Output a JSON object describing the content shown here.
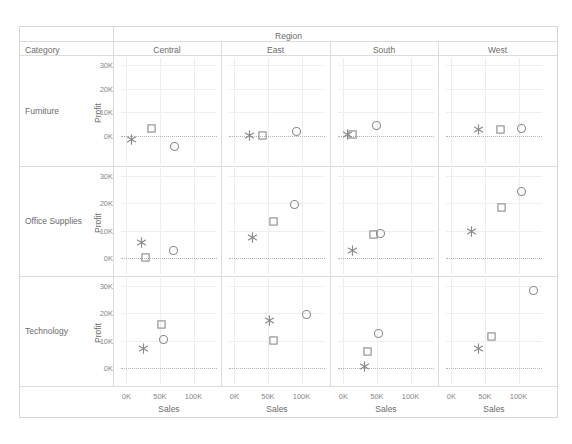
{
  "header": {
    "region_label": "Region",
    "category_label": "Category",
    "columns": [
      "Central",
      "East",
      "South",
      "West"
    ]
  },
  "rows": [
    {
      "label": "Furniture",
      "y_title": "Profit",
      "y_ticks": [
        "30K",
        "20K",
        "10K",
        "0K"
      ],
      "y_values": [
        30000,
        20000,
        10000,
        0
      ],
      "ylim": [
        -12000,
        33000
      ]
    },
    {
      "label": "Office Supplies",
      "y_title": "Profit",
      "y_ticks": [
        "30K",
        "20K",
        "10K",
        "0K"
      ],
      "y_values": [
        30000,
        20000,
        10000,
        0
      ],
      "ylim": [
        -6000,
        33000
      ]
    },
    {
      "label": "Technology",
      "y_title": "Profit",
      "y_ticks": [
        "30K",
        "20K",
        "10K",
        "0K"
      ],
      "y_values": [
        30000,
        20000,
        10000,
        0
      ],
      "ylim": [
        -6000,
        33000
      ]
    }
  ],
  "x_axis": {
    "title": "Sales",
    "ticks": [
      "0K",
      "50K",
      "100K"
    ],
    "values": [
      0,
      50000,
      100000
    ],
    "xlim": [
      -8000,
      135000
    ]
  },
  "marks": {
    "star": "star-marker",
    "square": "square-marker",
    "circle": "circle-marker"
  },
  "colors": {
    "mark_stroke": "#8b8b8b",
    "grid": "#ededed",
    "zero_line": "#b4b4b4",
    "frame": "#d6d6d6",
    "text": "#6b6b6b",
    "tick_text": "#888888"
  },
  "chart_data": {
    "type": "scatter",
    "title": "",
    "xlabel": "Sales",
    "ylabel": "Profit",
    "grid": true,
    "legend_position": "none",
    "xlim": [
      -8000,
      135000
    ],
    "ylim": [
      -12000,
      33000
    ],
    "xticks": [
      0,
      50000,
      100000
    ],
    "yticks": [
      0,
      10000,
      20000,
      30000
    ],
    "row_facets": [
      "Furniture",
      "Office Supplies",
      "Technology"
    ],
    "column_facets": [
      "Central",
      "East",
      "South",
      "West"
    ],
    "mark_shapes": [
      "star",
      "square",
      "circle"
    ],
    "panels": [
      {
        "row": "Furniture",
        "column": "Central",
        "points": [
          {
            "shape": "star",
            "x": 8000,
            "y": -1500
          },
          {
            "shape": "square",
            "x": 38000,
            "y": 3000
          },
          {
            "shape": "circle",
            "x": 72000,
            "y": -4500
          }
        ]
      },
      {
        "row": "Furniture",
        "column": "East",
        "points": [
          {
            "shape": "star",
            "x": 22000,
            "y": 200
          },
          {
            "shape": "square",
            "x": 42000,
            "y": 0
          },
          {
            "shape": "circle",
            "x": 93000,
            "y": 2000
          }
        ]
      },
      {
        "row": "Furniture",
        "column": "South",
        "points": [
          {
            "shape": "star",
            "x": 6000,
            "y": 500
          },
          {
            "shape": "square",
            "x": 13000,
            "y": 500
          },
          {
            "shape": "circle",
            "x": 50000,
            "y": 4500
          }
        ]
      },
      {
        "row": "Furniture",
        "column": "West",
        "points": [
          {
            "shape": "star",
            "x": 40000,
            "y": 2500
          },
          {
            "shape": "square",
            "x": 73000,
            "y": 2800
          },
          {
            "shape": "circle",
            "x": 105000,
            "y": 3200
          }
        ]
      },
      {
        "row": "Office Supplies",
        "column": "Central",
        "points": [
          {
            "shape": "star",
            "x": 23000,
            "y": 5500
          },
          {
            "shape": "square",
            "x": 28000,
            "y": 0
          },
          {
            "shape": "circle",
            "x": 70000,
            "y": 2500
          }
        ]
      },
      {
        "row": "Office Supplies",
        "column": "East",
        "points": [
          {
            "shape": "star",
            "x": 27000,
            "y": 7500
          },
          {
            "shape": "square",
            "x": 58000,
            "y": 13500
          },
          {
            "shape": "circle",
            "x": 90000,
            "y": 19500
          }
        ]
      },
      {
        "row": "Office Supplies",
        "column": "South",
        "points": [
          {
            "shape": "star",
            "x": 13000,
            "y": 2500
          },
          {
            "shape": "square",
            "x": 45000,
            "y": 8500
          },
          {
            "shape": "circle",
            "x": 55000,
            "y": 9000
          }
        ]
      },
      {
        "row": "Office Supplies",
        "column": "West",
        "points": [
          {
            "shape": "star",
            "x": 30000,
            "y": 9500
          },
          {
            "shape": "square",
            "x": 75000,
            "y": 18500
          },
          {
            "shape": "circle",
            "x": 105000,
            "y": 24500
          }
        ]
      },
      {
        "row": "Technology",
        "column": "Central",
        "points": [
          {
            "shape": "star",
            "x": 25000,
            "y": 7000
          },
          {
            "shape": "square",
            "x": 52000,
            "y": 16000
          },
          {
            "shape": "circle",
            "x": 55000,
            "y": 10500
          }
        ]
      },
      {
        "row": "Technology",
        "column": "East",
        "points": [
          {
            "shape": "star",
            "x": 53000,
            "y": 17500
          },
          {
            "shape": "square",
            "x": 58000,
            "y": 10000
          },
          {
            "shape": "circle",
            "x": 108000,
            "y": 19500
          }
        ]
      },
      {
        "row": "Technology",
        "column": "South",
        "points": [
          {
            "shape": "star",
            "x": 32000,
            "y": 500
          },
          {
            "shape": "square",
            "x": 36000,
            "y": 6000
          },
          {
            "shape": "circle",
            "x": 53000,
            "y": 12500
          }
        ]
      },
      {
        "row": "Technology",
        "column": "West",
        "points": [
          {
            "shape": "star",
            "x": 40000,
            "y": 7000
          },
          {
            "shape": "square",
            "x": 60000,
            "y": 11500
          },
          {
            "shape": "circle",
            "x": 122000,
            "y": 28500
          }
        ]
      }
    ]
  }
}
